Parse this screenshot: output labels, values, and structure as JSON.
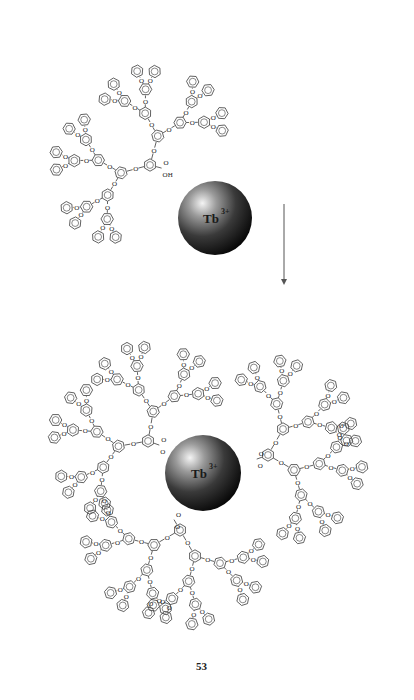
{
  "figure": {
    "caption": "53",
    "caption_pos": {
      "x": 196,
      "y": 660
    },
    "arrow": {
      "x": 284,
      "y1": 204,
      "y2": 282,
      "color": "#555555"
    },
    "ion_label": "Tb",
    "ion_charge": "3+",
    "spheres": [
      {
        "name": "free-ion",
        "cx": 215,
        "cy": 218,
        "r": 37
      },
      {
        "name": "complexed-ion",
        "cx": 203,
        "cy": 473,
        "r": 38
      }
    ],
    "acid_label": "OH",
    "o_label": "O",
    "colors": {
      "bond": "#3a3a3a",
      "sphere_dark": "#0c0c0c",
      "sphere_mid": "#5a5a5a",
      "sphere_light": "#f0f0f0"
    },
    "dendrons": [
      {
        "name": "free-dendron",
        "focal": [
          150,
          165
        ],
        "wedges": [
          {
            "angle": -75,
            "scale": 1.0
          },
          {
            "angle": -195,
            "scale": 1.0
          }
        ],
        "acid": {
          "x": 170,
          "y": 160,
          "angle": 15,
          "free": true
        }
      },
      {
        "name": "bound-dendron-upper-left",
        "focal": [
          148,
          441
        ],
        "wedges": [
          {
            "angle": -80,
            "scale": 1.0
          },
          {
            "angle": -190,
            "scale": 1.0
          }
        ],
        "acid": {
          "x": 163,
          "y": 448,
          "angle": 20,
          "free": false
        }
      },
      {
        "name": "bound-dendron-right",
        "focal": [
          268,
          455
        ],
        "wedges": [
          {
            "angle": -60,
            "scale": 1.0
          },
          {
            "angle": 30,
            "scale": 1.0
          }
        ],
        "acid": {
          "x": 256,
          "y": 472,
          "angle": 160,
          "free": false
        }
      },
      {
        "name": "bound-dendron-bottom",
        "focal": [
          180,
          530
        ],
        "wedges": [
          {
            "angle": 150,
            "scale": 1.0
          },
          {
            "angle": 60,
            "scale": 1.0
          }
        ],
        "acid": {
          "x": 172,
          "y": 515,
          "angle": -120,
          "free": false
        }
      }
    ]
  }
}
